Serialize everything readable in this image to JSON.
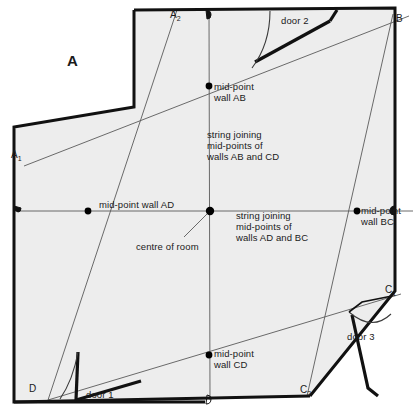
{
  "diagram": {
    "figure_label": "A",
    "colors": {
      "wall_stroke": "#111111",
      "room_fill": "#eeeeee",
      "string_stroke": "#555555",
      "marker_fill": "#000000",
      "text": "#1a1a1a",
      "page_background": "#ffffff"
    },
    "corner_labels": [
      {
        "name": "corner-a1",
        "text": "A",
        "sub": "1",
        "x": 11,
        "y": 150
      },
      {
        "name": "corner-a2",
        "text": "A",
        "sub": "2",
        "x": 170,
        "y": 10
      },
      {
        "name": "corner-b",
        "text": "B",
        "sub": "",
        "x": 396,
        "y": 14
      },
      {
        "name": "corner-c1",
        "text": "C",
        "sub": "1",
        "x": 386,
        "y": 285
      },
      {
        "name": "corner-c2",
        "text": "C",
        "sub": "2",
        "x": 300,
        "y": 385
      },
      {
        "name": "corner-d",
        "text": "D",
        "sub": "",
        "x": 30,
        "y": 384
      }
    ],
    "annotations": [
      {
        "name": "midpoint-wall-ab-label",
        "text": "mid-point\nwall AB",
        "x": 214,
        "y": 83
      },
      {
        "name": "string-ab-cd-label",
        "text": "string joining\nmid-points of\nwalls AB and CD",
        "x": 207,
        "y": 131
      },
      {
        "name": "midpoint-wall-ad-label",
        "text": "mid-point wall AD",
        "x": 99,
        "y": 201
      },
      {
        "name": "centre-of-room-label",
        "text": "centre of room",
        "x": 138,
        "y": 243
      },
      {
        "name": "string-ad-bc-label",
        "text": "string joining\nmid-points of\nwalls AD and BC",
        "x": 236,
        "y": 212
      },
      {
        "name": "midpoint-wall-bc-label",
        "text": "mid-point\nwall BC",
        "x": 361,
        "y": 207
      },
      {
        "name": "midpoint-wall-cd-label",
        "text": "mid-point\nwall CD",
        "x": 214,
        "y": 350
      },
      {
        "name": "door-1-label",
        "text": "door 1",
        "x": 86,
        "y": 390
      },
      {
        "name": "door-2-label",
        "text": "door 2",
        "x": 282,
        "y": 16
      },
      {
        "name": "door-3-label",
        "text": "door 3",
        "x": 348,
        "y": 333
      }
    ],
    "geometry": {
      "room_outline": "M 134,10 L 134,107 L 14,127 L 14,402 L 205,402 L 213,396 L 310,396 L 395,290 L 395,8 L 203,8 Z",
      "walls": [
        {
          "name": "wall-top-notch-vertical",
          "d": "M 134,10 L 134,107"
        },
        {
          "name": "wall-notch-horizontal",
          "d": "M 134,107 L 14,127"
        },
        {
          "name": "wall-ad-left",
          "d": "M 14,127 L 14,402"
        },
        {
          "name": "wall-cd-bottom",
          "d": "M 14,402 L 310,396"
        },
        {
          "name": "wall-c1-c2-diagonal",
          "d": "M 310,396 L 395,290"
        },
        {
          "name": "wall-bc-right",
          "d": "M 395,290 L 395,8"
        },
        {
          "name": "wall-ab-top",
          "d": "M 395,8 L 134,10"
        }
      ],
      "door_1": {
        "leaf": "M 61,399 L 141,380 L 137,372",
        "arc": "M 78,352 Q 74,378 64,398"
      },
      "door_2": {
        "leaf": "M 254,62 L 330,20 L 333,14",
        "arc": "M 270,12 Q 269,42 254,63"
      },
      "door_3": {
        "leaf": "M 352,314 L 370,396 L 378,395",
        "arc": "M 354,314 Q 370,330 388,316"
      },
      "notch_detail": "M 353,316 L 362,307 L 390,301",
      "strings": [
        {
          "name": "string-ab-cd",
          "d": "M 209,12 L 210,400",
          "note": "vertical string"
        },
        {
          "name": "string-ad-bc",
          "d": "M 14,211 L 412,211",
          "note": "horizontal string"
        },
        {
          "name": "string-a1-b",
          "d": "M 24,166 L 408,16",
          "note": "diagonal corner A1 to B"
        },
        {
          "name": "string-a2-d",
          "d": "M 177,10 L 48,400",
          "note": "diagonal corner A2 to D"
        },
        {
          "name": "string-c1-d",
          "d": "M 48,400 L 400,294",
          "note": "diagonal D to C1"
        },
        {
          "name": "string-b-c2",
          "d": "M 393,14 L 307,395",
          "note": "diagonal B to C2"
        }
      ],
      "markers": [
        {
          "name": "marker-midpoint-wall-ab",
          "cx": 209,
          "cy": 86,
          "r": 3.4
        },
        {
          "name": "marker-midpoint-wall-ad",
          "cx": 88,
          "cy": 211,
          "r": 3.4
        },
        {
          "name": "marker-centre-of-room",
          "cx": 210,
          "cy": 211,
          "r": 4.0
        },
        {
          "name": "marker-midpoint-wall-bc",
          "cx": 357,
          "cy": 211,
          "r": 3.4
        },
        {
          "name": "marker-midpoint-wall-cd",
          "cx": 209,
          "cy": 355,
          "r": 3.4
        }
      ],
      "pins": [
        {
          "name": "pin-top-wall",
          "x": 209,
          "y": 11
        },
        {
          "name": "pin-left-wall",
          "x": 16,
          "y": 210
        },
        {
          "name": "pin-bottom-wall",
          "x": 209,
          "y": 399
        },
        {
          "name": "pin-right-wall",
          "x": 394,
          "y": 209
        }
      ]
    }
  }
}
